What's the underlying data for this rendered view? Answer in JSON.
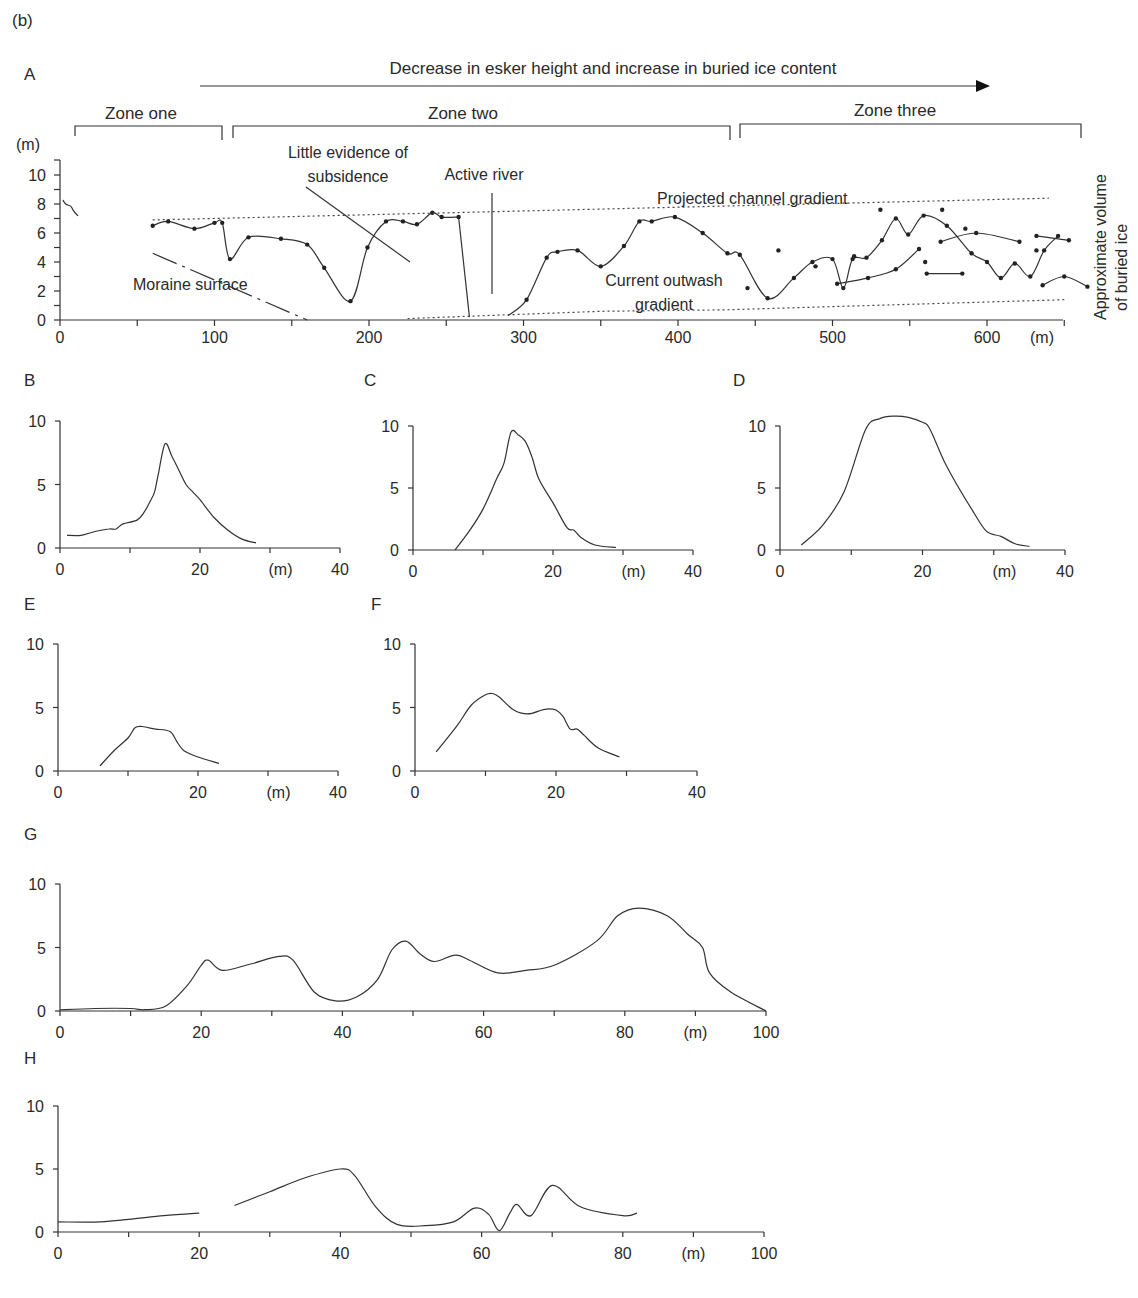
{
  "figure_label": "(b)",
  "panel_a": {
    "label": "A",
    "arrow_text": "Decrease in esker height and increase in buried ice content",
    "zones": [
      {
        "label": "Zone one",
        "x_start": 10,
        "x_end": 105
      },
      {
        "label": "Zone two",
        "x_start": 112,
        "x_end": 432
      },
      {
        "label": "Zone three",
        "x_start": 440,
        "x_end": 660
      }
    ],
    "y_unit": "(m)",
    "x_unit": "(m)",
    "right_label_line1": "Approximate volume",
    "right_label_line2": "of buried ice",
    "annotations": {
      "subsidence_line1": "Little evidence of",
      "subsidence_line2": "subsidence",
      "active_river": "Active river",
      "projected": "Projected channel gradient",
      "moraine": "Moraine surface",
      "outwash_line1": "Current outwash",
      "outwash_line2": "gradient"
    },
    "y_ticks": [
      "0",
      "2",
      "4",
      "6",
      "8",
      "10"
    ],
    "x_ticks": [
      "0",
      "100",
      "200",
      "300",
      "400",
      "500",
      "600"
    ]
  },
  "panels_small": [
    {
      "label": "B",
      "x_unit": "(m)",
      "x_ticks": [
        "0",
        "20",
        "40"
      ],
      "y_ticks": [
        "0",
        "5",
        "10"
      ]
    },
    {
      "label": "C",
      "x_unit": "(m)",
      "x_ticks": [
        "0",
        "20",
        "40"
      ],
      "y_ticks": [
        "0",
        "5",
        "10"
      ]
    },
    {
      "label": "D",
      "x_unit": "(m)",
      "x_ticks": [
        "0",
        "20",
        "40"
      ],
      "y_ticks": [
        "0",
        "5",
        "10"
      ]
    },
    {
      "label": "E",
      "x_unit": "(m)",
      "x_ticks": [
        "0",
        "20",
        "40"
      ],
      "y_ticks": [
        "0",
        "5",
        "10"
      ]
    },
    {
      "label": "F",
      "x_unit": "",
      "x_ticks": [
        "0",
        "20",
        "40"
      ],
      "y_ticks": [
        "0",
        "5",
        "10"
      ]
    }
  ],
  "panels_wide": [
    {
      "label": "G",
      "x_unit": "(m)",
      "x_ticks": [
        "0",
        "20",
        "40",
        "60",
        "80",
        "100"
      ],
      "y_ticks": [
        "0",
        "5",
        "10"
      ]
    },
    {
      "label": "H",
      "x_unit": "(m)",
      "x_ticks": [
        "0",
        "20",
        "40",
        "60",
        "80",
        "100"
      ],
      "y_ticks": [
        "0",
        "5",
        "10"
      ]
    }
  ],
  "chart_data": [
    {
      "id": "A",
      "type": "line",
      "title": "Longitudinal esker profile",
      "xlabel": "(m)",
      "ylabel": "(m)",
      "xlim": [
        0,
        650
      ],
      "ylim": [
        0,
        10
      ],
      "annotations": [
        "Decrease in esker height and increase in buried ice content",
        "Zone one",
        "Zone two",
        "Zone three",
        "Little evidence of subsidence",
        "Active river",
        "Projected channel gradient",
        "Moraine surface",
        "Current outwash gradient",
        "Approximate volume of buried ice"
      ],
      "series": [
        {
          "name": "Esker crest (zone one/two)",
          "x": [
            60,
            70,
            87,
            100,
            105,
            110,
            122,
            143,
            160,
            171,
            188,
            199,
            211,
            222,
            231,
            241,
            247,
            258,
            265
          ],
          "y": [
            6.5,
            6.8,
            6.3,
            6.7,
            6.7,
            4.2,
            5.7,
            5.6,
            5.2,
            3.6,
            1.3,
            5.0,
            6.8,
            6.8,
            6.6,
            7.4,
            7.1,
            7.1,
            0.2
          ]
        },
        {
          "name": "Esker crest (zone two)",
          "x": [
            290,
            302,
            315,
            322,
            335,
            350,
            365,
            375,
            383,
            398,
            416,
            432,
            440,
            458,
            475,
            487,
            500,
            507,
            513,
            522,
            532,
            541,
            549,
            559,
            574,
            590,
            600,
            609,
            618,
            628,
            637,
            646
          ],
          "y": [
            0.3,
            1.4,
            4.3,
            4.7,
            4.8,
            3.7,
            5.1,
            6.8,
            6.8,
            7.1,
            6.0,
            4.6,
            4.5,
            1.5,
            2.9,
            4.0,
            4.2,
            2.2,
            4.2,
            4.3,
            5.5,
            7.0,
            5.9,
            7.2,
            6.5,
            4.6,
            4.0,
            2.9,
            3.9,
            3.0,
            4.8,
            5.8
          ]
        },
        {
          "name": "Projected channel gradient",
          "x": [
            60,
            640
          ],
          "y": [
            6.9,
            8.4
          ]
        },
        {
          "name": "Current outwash gradient",
          "x": [
            225,
            350,
            430,
            650
          ],
          "y": [
            0.1,
            0.6,
            0.7,
            1.4
          ]
        },
        {
          "name": "Moraine surface",
          "x": [
            60,
            160
          ],
          "y": [
            4.6,
            0
          ]
        }
      ]
    },
    {
      "id": "B",
      "type": "line",
      "xlabel": "(m)",
      "xlim": [
        0,
        40
      ],
      "ylim": [
        0,
        10
      ],
      "x": [
        1,
        3,
        5,
        7,
        8,
        9,
        11,
        12,
        13,
        13.5,
        14,
        15,
        16,
        17,
        18,
        19,
        20,
        22,
        24,
        26,
        28
      ],
      "y": [
        1,
        1,
        1.3,
        1.5,
        1.5,
        1.9,
        2.2,
        2.8,
        3.8,
        4.4,
        5.7,
        8.2,
        7.2,
        6.1,
        5.0,
        4.4,
        3.8,
        2.4,
        1.4,
        0.7,
        0.4
      ]
    },
    {
      "id": "C",
      "type": "line",
      "xlabel": "(m)",
      "xlim": [
        0,
        40
      ],
      "ylim": [
        0,
        10
      ],
      "x": [
        6,
        8,
        10,
        12,
        13,
        14,
        15,
        16,
        17,
        18,
        20,
        22,
        23,
        24,
        26,
        29
      ],
      "y": [
        0,
        1.5,
        3.3,
        5.8,
        7.0,
        9.5,
        9.3,
        8.8,
        7.5,
        5.7,
        3.8,
        1.8,
        1.6,
        1.0,
        0.4,
        0.2
      ]
    },
    {
      "id": "D",
      "type": "line",
      "xlabel": "(m)",
      "xlim": [
        0,
        40
      ],
      "ylim": [
        0,
        10
      ],
      "x": [
        3,
        6,
        9,
        12,
        14,
        16,
        18,
        20,
        21,
        23,
        25,
        27,
        29,
        31,
        33,
        35
      ],
      "y": [
        0.4,
        2.0,
        4.7,
        9.7,
        10.6,
        10.8,
        10.7,
        10.3,
        9.8,
        7.2,
        5.1,
        3.2,
        1.5,
        1.1,
        0.5,
        0.3
      ]
    },
    {
      "id": "E",
      "type": "line",
      "xlabel": "(m)",
      "xlim": [
        0,
        40
      ],
      "ylim": [
        0,
        10
      ],
      "x": [
        6,
        8,
        10,
        11,
        12,
        13,
        14,
        16,
        17,
        18,
        20,
        23
      ],
      "y": [
        0.4,
        1.6,
        2.6,
        3.4,
        3.5,
        3.4,
        3.3,
        3.1,
        2.3,
        1.6,
        1.1,
        0.6
      ]
    },
    {
      "id": "F",
      "type": "line",
      "xlim": [
        0,
        40
      ],
      "ylim": [
        0,
        10
      ],
      "x": [
        3,
        6,
        8,
        10,
        11,
        12,
        14,
        16,
        18,
        19,
        20,
        21,
        22,
        23,
        24,
        26,
        29
      ],
      "y": [
        1.5,
        3.6,
        5.2,
        6.0,
        6.1,
        5.8,
        4.8,
        4.5,
        4.8,
        4.9,
        4.8,
        4.3,
        3.3,
        3.3,
        2.8,
        1.8,
        1.1
      ]
    },
    {
      "id": "G",
      "type": "line",
      "xlabel": "(m)",
      "xlim": [
        0,
        100
      ],
      "ylim": [
        0,
        10
      ],
      "x": [
        0,
        5,
        10,
        12,
        15,
        18,
        20,
        21,
        23,
        27,
        31,
        33,
        36,
        39,
        42,
        45,
        47,
        49,
        51,
        53,
        56,
        58,
        62,
        66,
        70,
        76,
        79,
        82,
        86,
        89,
        91,
        92,
        95,
        100
      ],
      "y": [
        0.1,
        0.2,
        0.2,
        0.1,
        0.4,
        2.0,
        3.6,
        4.0,
        3.2,
        3.7,
        4.3,
        4.0,
        1.5,
        0.8,
        1.1,
        2.5,
        4.8,
        5.5,
        4.5,
        3.9,
        4.4,
        4.0,
        3.0,
        3.2,
        3.6,
        5.5,
        7.5,
        8.1,
        7.5,
        6.0,
        5.0,
        3.0,
        1.5,
        0
      ]
    },
    {
      "id": "H",
      "type": "line",
      "xlabel": "(m)",
      "xlim": [
        0,
        100
      ],
      "ylim": [
        0,
        10
      ],
      "segments": [
        {
          "x": [
            0,
            6,
            10,
            15,
            20
          ],
          "y": [
            0.8,
            0.8,
            1.0,
            1.3,
            1.5
          ]
        },
        {
          "x": [
            25,
            30,
            35,
            40,
            42,
            45,
            48,
            52,
            56,
            59,
            61,
            62.5,
            64,
            65,
            67,
            70,
            74,
            80,
            82
          ],
          "y": [
            2.1,
            3.2,
            4.3,
            5.0,
            4.5,
            2.0,
            0.6,
            0.5,
            0.8,
            1.9,
            1.4,
            0.1,
            1.5,
            2.2,
            1.3,
            3.7,
            2.0,
            1.3,
            1.5
          ]
        }
      ]
    }
  ]
}
